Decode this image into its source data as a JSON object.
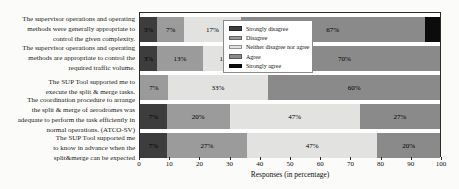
{
  "chart_data": {
    "type": "bar",
    "orientation": "horizontal",
    "stacked": true,
    "title": "",
    "xlabel": "Responses (in percentage)",
    "xlim": [
      0,
      100
    ],
    "xticks": [
      0,
      10,
      20,
      30,
      40,
      50,
      60,
      70,
      80,
      90,
      100
    ],
    "grid": false,
    "legend_position": "upper center inside plot",
    "categories": [
      "The supervisor operations and operating\nmethods were generally appropriate to\ncontrol the given complexity.",
      "The supervisor operations and operating\nmethods are appropriate to control the\nrequired traffic volume.",
      "The SUP Tool supported me to\nexecute the split & merge tasks.",
      "The coordination procedure to arrange\nthe split & merge of aerodromes was\nadequate to perform the task efficiently in\nnormal operations.  (ATCO-SV)",
      "The SUP Tool supported me\nto know in advance when the\nsplit&merge can be expected"
    ],
    "series": [
      {
        "name": "Strongly disagree",
        "color": "#3d3d3d",
        "values": [
          3,
          3,
          0,
          7,
          7
        ],
        "bar_labels": [
          "3%",
          "3%",
          "",
          "7%",
          "7%"
        ]
      },
      {
        "name": "Disagree",
        "color": "#9b9b9b",
        "values": [
          7,
          13,
          7,
          20,
          27
        ],
        "bar_labels": [
          "7%",
          "13%",
          "7%",
          "20%",
          "27%"
        ]
      },
      {
        "name": "Neither disagree nor agree",
        "color": "#e2e2e0",
        "values": [
          17,
          13,
          33,
          47,
          47
        ],
        "bar_labels": [
          "17%",
          "13%",
          "33%",
          "47%",
          "47%"
        ]
      },
      {
        "name": "Agree",
        "color": "#8a8a8a",
        "values": [
          67,
          70,
          60,
          27,
          20
        ],
        "bar_labels": [
          "67%",
          "70%",
          "60%",
          "27%",
          "20%"
        ]
      },
      {
        "name": "Strongly agree",
        "color": "#0c0c0c",
        "values": [
          6,
          0,
          0,
          0,
          0
        ],
        "bar_labels": [
          "",
          "",
          "",
          "",
          ""
        ]
      }
    ]
  }
}
